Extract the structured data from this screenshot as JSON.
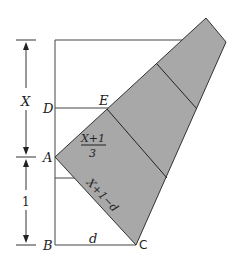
{
  "diagram": {
    "points": {
      "D": "D",
      "E": "E",
      "A": "A",
      "B": "B",
      "C": "C"
    },
    "dimensions": {
      "upper": "X",
      "lower": "1",
      "base": "d"
    },
    "fraction": {
      "numerator": "X+1",
      "denominator": "3"
    },
    "slant_label": "X+1−d",
    "colors": {
      "fill": "#a8a8a8",
      "stroke": "#333333"
    }
  }
}
